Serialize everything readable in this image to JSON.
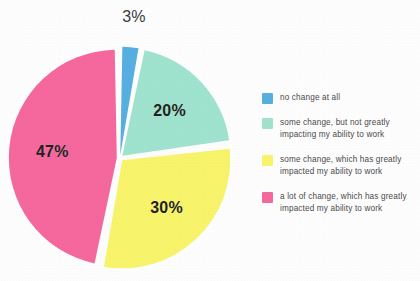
{
  "chart_data": {
    "type": "pie",
    "title": "",
    "subtitle": "",
    "xlabel": "",
    "ylabel": "",
    "grid": false,
    "legend_position": "right",
    "categories": [
      "no change at all",
      "some change, but not greatly impacting my ability to work",
      "some change, which has greatly impacted my ability to work",
      "a lot of change, which has greatly impacted my ability to work"
    ],
    "values": [
      3,
      20,
      30,
      47
    ],
    "value_labels": [
      "3%",
      "20%",
      "30%",
      "47%"
    ],
    "colors": [
      "#57AEE0",
      "#9FE2CD",
      "#F7F36A",
      "#F4689E"
    ],
    "slices": [
      {
        "label": "no change at all",
        "value": 3,
        "value_label": "3%",
        "color": "#57AEE0",
        "label_position": "outside"
      },
      {
        "label": "some change, but not greatly impacting my ability to work",
        "value": 20,
        "value_label": "20%",
        "color": "#9FE2CD",
        "label_position": "inside"
      },
      {
        "label": "some change, which has greatly impacted my ability to work",
        "value": 30,
        "value_label": "30%",
        "color": "#F7F36A",
        "label_position": "inside"
      },
      {
        "label": "a lot of change, which has greatly impacted my ability to work",
        "value": 47,
        "value_label": "47%",
        "color": "#F4689E",
        "label_position": "inside"
      }
    ]
  },
  "legend": {
    "items": [
      {
        "label": "no change at all",
        "color": "#57AEE0"
      },
      {
        "label": "some change, but not greatly impacting my ability to work",
        "color": "#9FE2CD"
      },
      {
        "label": "some change, which has greatly impacted my ability to work",
        "color": "#F7F36A"
      },
      {
        "label": "a lot of change, which has greatly impacted my ability to work",
        "color": "#F4689E"
      }
    ]
  }
}
